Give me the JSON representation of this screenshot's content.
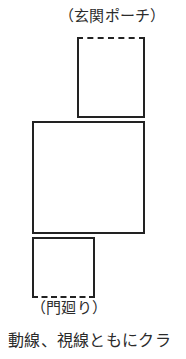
{
  "diagram": {
    "labels": {
      "entrance_porch": "（玄関ポーチ）",
      "gate_area": "（門廻り）"
    },
    "caption": "動線、視線ともにクラ",
    "shapes": [
      {
        "name": "entrance-porch-area",
        "label": "（玄関ポーチ）",
        "edges": {
          "top": "dashed",
          "right": "solid",
          "bottom": "solid",
          "left": "solid"
        }
      },
      {
        "name": "main-room-area",
        "label": "",
        "edges": {
          "top": "solid",
          "right": "solid",
          "bottom": "solid",
          "left": "solid"
        }
      },
      {
        "name": "gate-area",
        "label": "（門廻り）",
        "edges": {
          "top": "solid",
          "right": "solid",
          "bottom": "dashed",
          "left": "solid"
        }
      }
    ],
    "colors": {
      "line": "#222222",
      "text": "#2b2b2b",
      "background": "#ffffff"
    }
  }
}
